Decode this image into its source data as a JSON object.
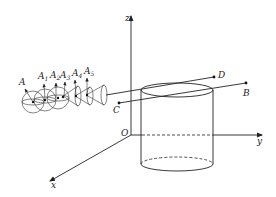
{
  "figure": {
    "axes": {
      "origin_label": "O",
      "x_label": "x",
      "y_label": "y",
      "z_label": "z"
    },
    "points": {
      "A": "A",
      "A1": {
        "main": "A",
        "sub": "1"
      },
      "A2": {
        "main": "A",
        "sub": "2"
      },
      "A3": {
        "main": "A",
        "sub": "3"
      },
      "A4": {
        "main": "A",
        "sub": "4"
      },
      "A5": {
        "main": "A",
        "sub": "5"
      },
      "B": "B",
      "C": "C",
      "D": "D"
    },
    "colors": {
      "line": "#222222",
      "background": "#ffffff"
    }
  }
}
